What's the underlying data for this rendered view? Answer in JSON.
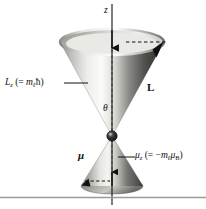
{
  "figure": {
    "background_color": "#ffffff",
    "width": 206,
    "height": 209
  },
  "labels": {
    "z_axis": "z",
    "theta": "θ",
    "angular_momentum_vector": "L",
    "magnetic_moment_vector": "μ",
    "lz": {
      "symbol": "L",
      "subscript": "z",
      "expression_open": "  (= ",
      "m_symbol": "m",
      "m_subscript": "ℓ",
      "hbar": "ħ",
      "expression_close": ")"
    },
    "muz": {
      "symbol": "μ",
      "subscript": "z",
      "expression_open": " (= −",
      "m_symbol": "m",
      "m_subscript": "ℓ",
      "mu_symbol": "μ",
      "mu_subscript": "B",
      "expression_close": ")"
    }
  },
  "colors": {
    "line": "#111111",
    "cone_light": "#f2f2f0",
    "cone_mid": "#b9b9b5",
    "cone_dark": "#4a4a48",
    "cone_darkest": "#2e2e2c",
    "rim_top": "#cfcfca",
    "rim_shadow": "#8e8e8a",
    "vertex_dot": "#111111",
    "divider": "#9a9a96"
  },
  "geometry": {
    "axis_x": 112,
    "vertex_y": 136,
    "upper_rim_y": 42,
    "upper_rim_rx": 52,
    "upper_rim_ry": 13,
    "lower_rim_y": 186,
    "lower_rim_rx": 31,
    "lower_rim_ry": 8
  }
}
